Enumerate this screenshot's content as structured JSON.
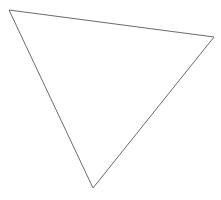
{
  "diagram": {
    "background": "#ffffff",
    "shapes": [
      {
        "type": "triangle",
        "vertices": [
          [
            9,
            10
          ],
          [
            214,
            37
          ],
          [
            93,
            188
          ]
        ],
        "stroke": "#6b6b6b",
        "stroke_width": 1,
        "fill": "none"
      }
    ]
  }
}
